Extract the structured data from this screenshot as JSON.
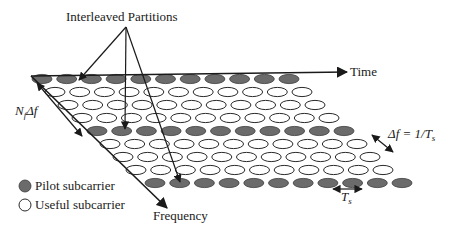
{
  "title": "Interleaved Partitions",
  "axes": {
    "time_label": "Time",
    "frequency_label": "Frequency"
  },
  "annotations": {
    "bandwidth_label_main": "N",
    "bandwidth_label_sub": "f",
    "bandwidth_label_tail": "Δf",
    "subcarrier_spacing_label": "Δf = 1/T",
    "subcarrier_spacing_sub": "s",
    "symbol_period_label": "T",
    "symbol_period_sub": "s"
  },
  "legend": {
    "items": [
      {
        "label": "Pilot subcarrier",
        "kind": "pilot"
      },
      {
        "label": "Useful subcarrier",
        "kind": "useful"
      }
    ]
  },
  "colors": {
    "pilot_fill": "#6b6b6b",
    "useful_fill": "#ffffff",
    "line": "#1a1a1a"
  },
  "grid": {
    "rows": 9,
    "columns": 11,
    "pilot_rows": [
      0,
      4,
      8
    ],
    "row_y": [
      79,
      92,
      105,
      118,
      131,
      144,
      157,
      170,
      183
    ],
    "row_x_start": [
      42,
      55,
      68,
      82,
      97,
      110,
      123,
      136,
      155
    ],
    "column_spacing": 24.7,
    "ellipse_rx": 10,
    "ellipse_ry": 4.6
  }
}
